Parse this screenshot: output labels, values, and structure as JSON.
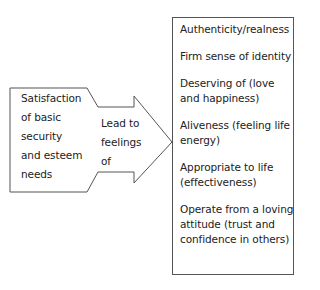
{
  "diagram": {
    "left_box": {
      "lines": [
        "Satisfaction",
        "of basic",
        "security",
        "and esteem",
        "needs"
      ]
    },
    "arrow": {
      "lines": [
        "Lead to",
        "feelings",
        "of"
      ]
    },
    "right_box": {
      "items": [
        "Authenticity/realness",
        "Firm sense of identity",
        "Deserving of (love and happiness)",
        "Aliveness (feeling life energy)",
        "Appropriate to life (effectiveness)",
        "Operate from a loving attitude (trust and confidence in others)"
      ]
    },
    "colors": {
      "stroke": "#555555",
      "text": "#222222",
      "background": "#ffffff"
    }
  }
}
